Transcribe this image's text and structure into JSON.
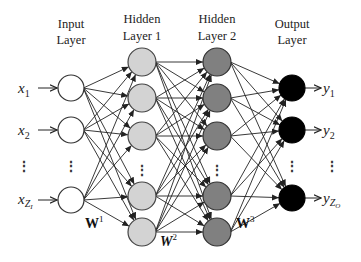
{
  "diagram": {
    "layers": [
      {
        "id": "input",
        "title_line1": "Input",
        "title_line2": "Layer",
        "x": 71,
        "r": 13,
        "fill": "#ffffff",
        "stroke": "#333333",
        "node_y": [
          88,
          130,
          200
        ],
        "ellipsis_y": 166
      },
      {
        "id": "hidden1",
        "title_line1": "Hidden",
        "title_line2": "Layer 1",
        "x": 142,
        "r": 14,
        "fill": "#d3d3d3",
        "stroke": "#444444",
        "node_y": [
          62,
          98,
          136,
          196,
          232
        ],
        "ellipsis_y": 170
      },
      {
        "id": "hidden2",
        "title_line1": "Hidden",
        "title_line2": "Layer 2",
        "x": 217,
        "r": 14,
        "fill": "#808080",
        "stroke": "#333333",
        "node_y": [
          62,
          98,
          136,
          196,
          232
        ],
        "ellipsis_y": 170
      },
      {
        "id": "output",
        "title_line1": "Output",
        "title_line2": "Layer",
        "x": 292,
        "r": 13,
        "fill": "#000000",
        "stroke": "#000000",
        "node_y": [
          88,
          130,
          198
        ],
        "ellipsis_y": 166
      }
    ],
    "inputs": [
      {
        "base": "x",
        "sub": "1"
      },
      {
        "base": "x",
        "sub": "2"
      },
      {
        "base": "x",
        "sub": "Z",
        "subsub": "I"
      }
    ],
    "outputs": [
      {
        "base": "y",
        "sub": "1"
      },
      {
        "base": "y",
        "sub": "2"
      },
      {
        "base": "y",
        "sub": "Z",
        "subsub": "O"
      }
    ],
    "weights": [
      {
        "label": "W",
        "sup": "1",
        "x": 85,
        "y": 228,
        "italic": false
      },
      {
        "label": "W",
        "sup": "2",
        "x": 160,
        "y": 246,
        "italic": true
      },
      {
        "label": "W",
        "sup": "3",
        "x": 236,
        "y": 228,
        "italic": false
      }
    ],
    "ellipsis": "⋮"
  }
}
